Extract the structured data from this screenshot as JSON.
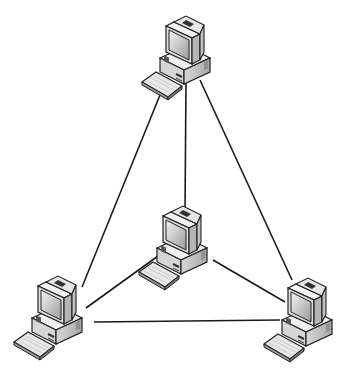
{
  "diagram": {
    "type": "network-topology",
    "topology": "full-mesh",
    "background": "#ffffff",
    "line_color": "#1a1a1a",
    "nodes": [
      {
        "id": "top",
        "label": "",
        "x": 182,
        "y": 52
      },
      {
        "id": "center",
        "label": "",
        "x": 180,
        "y": 245
      },
      {
        "id": "bottom-left",
        "label": "",
        "x": 55,
        "y": 315
      },
      {
        "id": "bottom-right",
        "label": "",
        "x": 305,
        "y": 318
      }
    ],
    "links": [
      {
        "from": "top",
        "to": "center",
        "x1": 186,
        "y1": 80,
        "x2": 185,
        "y2": 213
      },
      {
        "from": "top",
        "to": "bottom-left",
        "x1": 160,
        "y1": 95,
        "x2": 82,
        "y2": 287
      },
      {
        "from": "top",
        "to": "bottom-right",
        "x1": 200,
        "y1": 80,
        "x2": 292,
        "y2": 280
      },
      {
        "from": "center",
        "to": "bottom-left",
        "x1": 158,
        "y1": 256,
        "x2": 86,
        "y2": 308
      },
      {
        "from": "center",
        "to": "bottom-right",
        "x1": 213,
        "y1": 260,
        "x2": 285,
        "y2": 302
      },
      {
        "from": "bottom-left",
        "to": "bottom-right",
        "x1": 94,
        "y1": 322,
        "x2": 280,
        "y2": 320
      }
    ]
  }
}
